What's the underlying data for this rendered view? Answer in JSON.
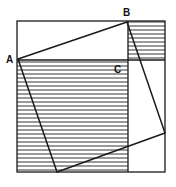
{
  "diagram": {
    "labels": {
      "a": "A",
      "b": "B",
      "c": "C"
    },
    "colors": {
      "stroke": "#1a1a1a",
      "hatch": "#333333",
      "background": "#ffffff"
    },
    "outer_square": {
      "x1": 17,
      "y1": 21,
      "x2": 165,
      "y2": 172
    },
    "inner_square_vertices": [
      [
        18,
        59
      ],
      [
        127,
        22
      ],
      [
        165,
        133
      ],
      [
        57,
        172
      ]
    ],
    "divider_horizontal_y": 60,
    "divider_vertical_x": 128,
    "hatched_regions": [
      {
        "name": "large-square-ac",
        "x": 17,
        "y": 60,
        "w": 111,
        "h": 112
      },
      {
        "name": "small-square-bc",
        "x": 128,
        "y": 21,
        "w": 37,
        "h": 39
      }
    ]
  }
}
